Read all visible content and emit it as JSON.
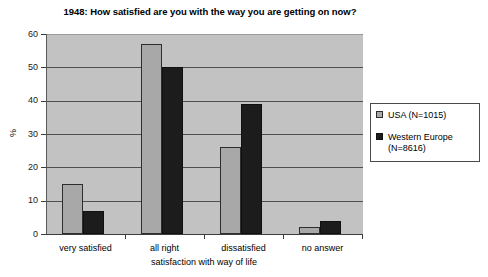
{
  "chart_data": {
    "type": "bar",
    "title": "1948: How satisfied are you with the way you are getting on now?",
    "xlabel": "satisfaction with way of life",
    "ylabel": "%",
    "categories": [
      "very satisfied",
      "all right",
      "dissatisfied",
      "no answer"
    ],
    "series": [
      {
        "name": "USA (N=1015)",
        "color": "#a8a8a8",
        "values": [
          15,
          57,
          26,
          2
        ]
      },
      {
        "name": "Western Europe (N=8616)",
        "color": "#1c1c1c",
        "values": [
          7,
          50,
          39,
          4
        ]
      }
    ],
    "ylim": [
      0,
      60
    ],
    "yticks": [
      0,
      10,
      20,
      30,
      40,
      50,
      60
    ],
    "grid": true,
    "legend_position": "right",
    "plot_background": "#c2c2c2"
  },
  "legend": {
    "entries": [
      {
        "label": "USA (N=1015)"
      },
      {
        "label": "Western Europe (N=8616)"
      }
    ]
  }
}
